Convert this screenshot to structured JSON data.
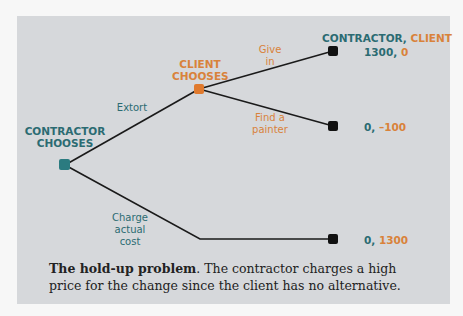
{
  "diagram": {
    "nodes": {
      "contractor": {
        "label_line1": "CONTRACTOR",
        "label_line2": "CHOOSES",
        "color": "#2b7b80"
      },
      "client": {
        "label_line1": "CLIENT",
        "label_line2": "CHOOSES",
        "color": "#e07a2e"
      }
    },
    "branches": {
      "extort": "Extort",
      "charge_line1": "Charge",
      "charge_line2": "actual",
      "charge_line3": "cost",
      "give_line1": "Give",
      "give_line2": "in",
      "find_line1": "Find a",
      "find_line2": "painter"
    },
    "payoff_header": {
      "contractor": "CONTRACTOR,",
      "client": "CLIENT"
    },
    "payoffs": [
      {
        "contractor": "1300,",
        "client": "0"
      },
      {
        "contractor": "0,",
        "client": "–100"
      },
      {
        "contractor": "0,",
        "client": "1300"
      }
    ]
  },
  "caption": {
    "title": "The hold-up problem",
    "text": ".  The contractor charges a high price for the change since the client has no alternative."
  }
}
